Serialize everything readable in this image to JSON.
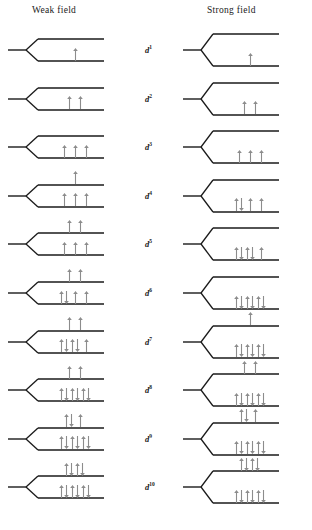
{
  "figure": {
    "headers": {
      "weak": "Weak field",
      "strong": "Strong field"
    },
    "colors": {
      "level_line": "#1a1a1a",
      "arrow": "#8c8c8c",
      "label_text": "#1a1a1a",
      "background": "#ffffff"
    },
    "geometry": {
      "weak_split_px": 22,
      "strong_split_px": 32,
      "note": "Strong field shows a larger splitting between lower and upper level sets"
    },
    "rows": [
      {
        "label_base": "d",
        "label_exp": "1",
        "weak": {
          "upper": [],
          "lower": [
            "single"
          ]
        },
        "strong": {
          "upper": [],
          "lower": [
            "single"
          ]
        }
      },
      {
        "label_base": "d",
        "label_exp": "2",
        "weak": {
          "upper": [],
          "lower": [
            "single",
            "single"
          ]
        },
        "strong": {
          "upper": [],
          "lower": [
            "single",
            "single"
          ]
        }
      },
      {
        "label_base": "d",
        "label_exp": "3",
        "weak": {
          "upper": [],
          "lower": [
            "single",
            "single",
            "single"
          ]
        },
        "strong": {
          "upper": [],
          "lower": [
            "single",
            "single",
            "single"
          ]
        }
      },
      {
        "label_base": "d",
        "label_exp": "4",
        "weak": {
          "upper": [
            "single"
          ],
          "lower": [
            "single",
            "single",
            "single"
          ]
        },
        "strong": {
          "upper": [],
          "lower": [
            "paired",
            "single",
            "single"
          ]
        }
      },
      {
        "label_base": "d",
        "label_exp": "5",
        "weak": {
          "upper": [
            "single",
            "single"
          ],
          "lower": [
            "single",
            "single",
            "single"
          ]
        },
        "strong": {
          "upper": [],
          "lower": [
            "paired",
            "paired",
            "single"
          ]
        }
      },
      {
        "label_base": "d",
        "label_exp": "6",
        "weak": {
          "upper": [
            "single",
            "single"
          ],
          "lower": [
            "paired",
            "single",
            "single"
          ]
        },
        "strong": {
          "upper": [],
          "lower": [
            "paired",
            "paired",
            "paired"
          ]
        }
      },
      {
        "label_base": "d",
        "label_exp": "7",
        "weak": {
          "upper": [
            "single",
            "single"
          ],
          "lower": [
            "paired",
            "paired",
            "single"
          ]
        },
        "strong": {
          "upper": [
            "single"
          ],
          "lower": [
            "paired",
            "paired",
            "paired"
          ]
        }
      },
      {
        "label_base": "d",
        "label_exp": "8",
        "weak": {
          "upper": [
            "single",
            "single"
          ],
          "lower": [
            "paired",
            "paired",
            "paired"
          ]
        },
        "strong": {
          "upper": [
            "single",
            "single"
          ],
          "lower": [
            "paired",
            "paired",
            "paired"
          ]
        }
      },
      {
        "label_base": "d",
        "label_exp": "9",
        "weak": {
          "upper": [
            "paired",
            "single"
          ],
          "lower": [
            "paired",
            "paired",
            "paired"
          ]
        },
        "strong": {
          "upper": [
            "paired",
            "single"
          ],
          "lower": [
            "paired",
            "paired",
            "paired"
          ]
        }
      },
      {
        "label_base": "d",
        "label_exp": "10",
        "weak": {
          "upper": [
            "paired",
            "paired"
          ],
          "lower": [
            "paired",
            "paired",
            "paired"
          ]
        },
        "strong": {
          "upper": [
            "paired",
            "paired"
          ],
          "lower": [
            "paired",
            "paired",
            "paired"
          ]
        }
      }
    ]
  }
}
